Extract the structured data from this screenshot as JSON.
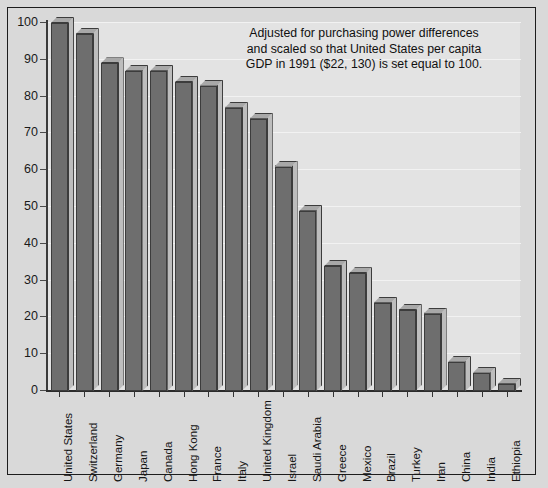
{
  "annotation": {
    "line1": "Adjusted for purchasing power differences",
    "line2": "and scaled so that United States per capita",
    "line3": "GDP in 1991 ($22, 130) is set equal to 100."
  },
  "colors": {
    "page_background": "#d9d9d9",
    "plot_background": "#e3e3e3",
    "bar_front": "#6e6e6e",
    "bar_top": "#a8a8a8",
    "bar_side": "#bdbdbd",
    "bar_outline": "#3c3c3c",
    "axis": "#2b2b2b",
    "gridline": "#f2f2f2",
    "text": "#101010"
  },
  "chart_data": {
    "type": "bar",
    "title": "",
    "xlabel": "",
    "ylabel": "",
    "ylim": [
      0,
      100
    ],
    "ytick_labels": [
      "0",
      "10",
      "20",
      "30",
      "40",
      "50",
      "60",
      "70",
      "80",
      "90",
      "100"
    ],
    "ytick_values": [
      0,
      10,
      20,
      30,
      40,
      50,
      60,
      70,
      80,
      90,
      100
    ],
    "grid": true,
    "legend": "none",
    "annotations": [
      "Adjusted for purchasing power differences and scaled so that United States per capita GDP in 1991 ($22, 130) is set equal to 100."
    ],
    "categories": [
      "United States",
      "Switzerland",
      "Germany",
      "Japan",
      "Canada",
      "Hong Kong",
      "France",
      "Italy",
      "United Kingdom",
      "Israel",
      "Saudi Arabia",
      "Greece",
      "Mexico",
      "Brazil",
      "Turkey",
      "Iran",
      "China",
      "India",
      "Ethiopia"
    ],
    "values": [
      100,
      97,
      89,
      87,
      87,
      84,
      83,
      77,
      74,
      61,
      49,
      34,
      32,
      24,
      22,
      21,
      8,
      5,
      2
    ]
  }
}
